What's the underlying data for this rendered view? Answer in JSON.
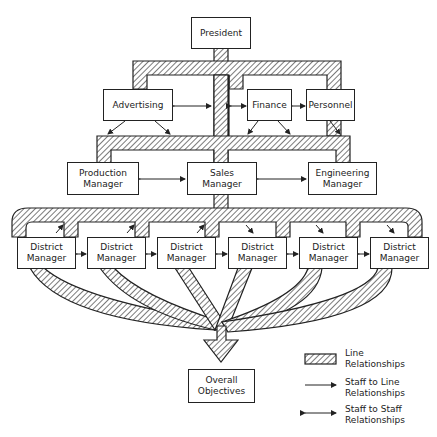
{
  "diagram": {
    "type": "organization-chart",
    "nodes": {
      "president": {
        "label": "President"
      },
      "advertising": {
        "label": "Advertising"
      },
      "finance": {
        "label": "Finance"
      },
      "personnel": {
        "label": "Personnel"
      },
      "production_manager": {
        "line1": "Production",
        "line2": "Manager"
      },
      "sales_manager": {
        "line1": "Sales",
        "line2": "Manager"
      },
      "engineering_manager": {
        "line1": "Engineering",
        "line2": "Manager"
      },
      "district_managers": [
        {
          "line1": "District",
          "line2": "Manager"
        },
        {
          "line1": "District",
          "line2": "Manager"
        },
        {
          "line1": "District",
          "line2": "Manager"
        },
        {
          "line1": "District",
          "line2": "Manager"
        },
        {
          "line1": "District",
          "line2": "Manager"
        },
        {
          "line1": "District",
          "line2": "Manager"
        }
      ],
      "overall_objectives": {
        "line1": "Overall",
        "line2": "Objectives"
      }
    },
    "legend": {
      "line": {
        "line1": "Line",
        "line2": "Relationships"
      },
      "staff_to_line": {
        "line1": "Staff to Line",
        "line2": "Relationships"
      },
      "staff_to_staff": {
        "line1": "Staff to Staff",
        "line2": "Relationships"
      }
    },
    "edges": [
      {
        "from": "president",
        "to": "advertising",
        "kind": "line"
      },
      {
        "from": "president",
        "to": "finance",
        "kind": "line"
      },
      {
        "from": "president",
        "to": "personnel",
        "kind": "line"
      },
      {
        "from": "president",
        "to": "production_manager",
        "kind": "line"
      },
      {
        "from": "president",
        "to": "sales_manager",
        "kind": "line"
      },
      {
        "from": "president",
        "to": "engineering_manager",
        "kind": "line"
      },
      {
        "from": "sales_manager",
        "to": "district_managers",
        "kind": "line"
      },
      {
        "from": "district_managers",
        "to": "overall_objectives",
        "kind": "line"
      },
      {
        "from": "advertising",
        "to": "finance",
        "kind": "staff-to-staff"
      },
      {
        "from": "finance",
        "to": "personnel",
        "kind": "staff-to-staff"
      },
      {
        "from": "production_manager",
        "to": "sales_manager",
        "kind": "staff-to-staff"
      },
      {
        "from": "sales_manager",
        "to": "engineering_manager",
        "kind": "staff-to-staff"
      },
      {
        "from": "district_managers",
        "to": "district_managers",
        "kind": "staff-to-staff"
      },
      {
        "from": "advertising",
        "to": "line",
        "kind": "staff-to-line"
      },
      {
        "from": "finance",
        "to": "line",
        "kind": "staff-to-line"
      },
      {
        "from": "personnel",
        "to": "line",
        "kind": "staff-to-line"
      }
    ],
    "colors": {
      "ink": "#222222",
      "paper": "#ffffff"
    }
  }
}
